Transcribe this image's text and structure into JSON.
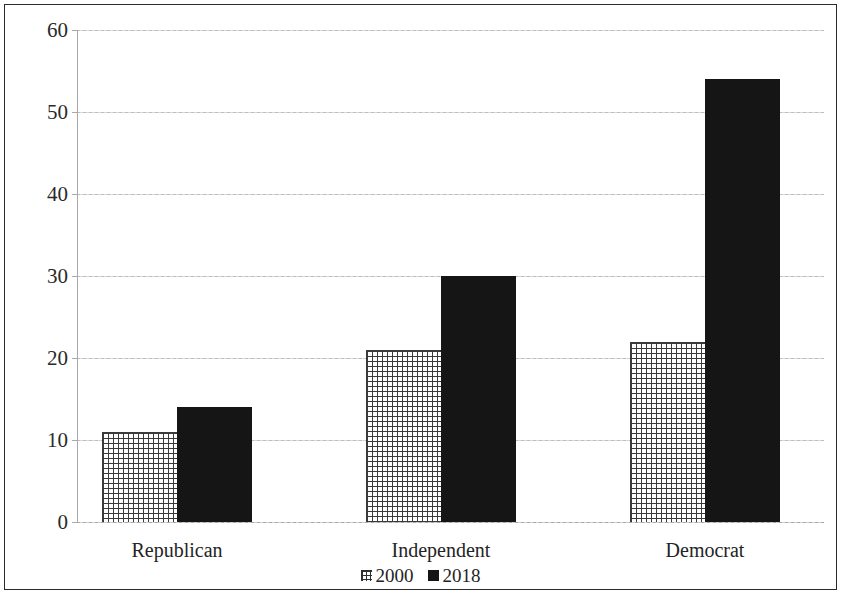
{
  "chart_data": {
    "type": "bar",
    "title": "",
    "subtitle": "",
    "xlabel": "",
    "ylabel": "",
    "categories": [
      "Republican",
      "Independent",
      "Democrat"
    ],
    "series": [
      {
        "name": "2000",
        "values": [
          11,
          21,
          22
        ],
        "style": "crosshatch",
        "color": "#3a3a3a"
      },
      {
        "name": "2018",
        "values": [
          14,
          30,
          54
        ],
        "style": "solid",
        "color": "#151515"
      }
    ],
    "ylim": [
      0,
      60
    ],
    "yticks": [
      0,
      10,
      20,
      30,
      40,
      50,
      60
    ],
    "ytick_labels": [
      "0",
      "10",
      "20",
      "30",
      "40",
      "50",
      "60"
    ],
    "grid": true,
    "grid_axis": "y",
    "legend": {
      "position": "bottom-center",
      "entries": [
        "2000",
        "2018"
      ]
    },
    "frame": {
      "border": true,
      "border_color": "#2b2b2b"
    },
    "annotations": []
  },
  "figure": {
    "background": "#ffffff",
    "axis_color": "#a9a9a9",
    "gridline_color": "#c9c9c9"
  }
}
